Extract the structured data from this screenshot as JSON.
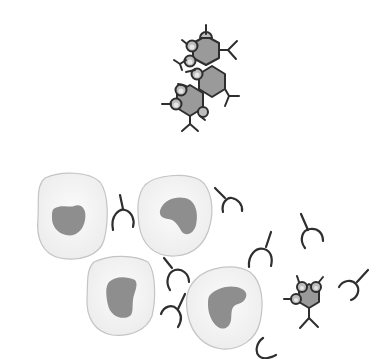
{
  "diagram": {
    "type": "immunology-illustration",
    "background": "#ffffff",
    "colors": {
      "stroke": "#2e2e2e",
      "hexagon_fill": "#9a9a9a",
      "bump_fill": "#bdbdbd",
      "cell_fill": "#f2f2f2",
      "cell_stroke": "#c4c4c4",
      "nucleus_fill": "#8e8e8e"
    },
    "groups": [
      {
        "name": "antigen-antibody-complex",
        "description": "Cluster of three hexagonal antigens with bound antibodies",
        "position": "top-center"
      },
      {
        "name": "cells-and-free-antibodies",
        "description": "Four cells with nuclei, scattered free antibodies and one small antigen",
        "position": "bottom"
      }
    ],
    "cells": [
      {
        "id": "cell-1",
        "cx": 72,
        "cy": 218,
        "nucleus": "kidney"
      },
      {
        "id": "cell-2",
        "cx": 173,
        "cy": 213,
        "nucleus": "kidney"
      },
      {
        "id": "cell-3",
        "cx": 121,
        "cy": 291,
        "nucleus": "kidney"
      },
      {
        "id": "cell-4",
        "cx": 225,
        "cy": 307,
        "nucleus": "kidney"
      }
    ],
    "free_antibody_count": 9,
    "antigen_count": 4
  }
}
